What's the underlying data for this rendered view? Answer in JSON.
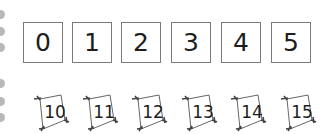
{
  "number_boxes": [
    "0",
    "1",
    "2",
    "3",
    "4",
    "5"
  ],
  "kites": [
    "10",
    "11",
    "12",
    "13",
    "14",
    "15"
  ],
  "margin_dots": 6,
  "colors": {
    "box_border": "#7a7a7a",
    "text": "#1e1e1e",
    "dot": "#b8b8b8"
  }
}
